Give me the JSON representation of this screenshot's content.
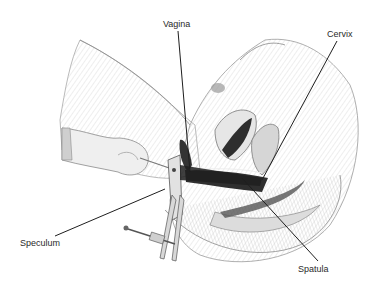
{
  "diagram": {
    "type": "anatomical-illustration",
    "labels": [
      {
        "id": "vagina",
        "text": "Vagina",
        "x": 163,
        "y": 19,
        "line": [
          178,
          31,
          190,
          172
        ]
      },
      {
        "id": "cervix",
        "text": "Cervix",
        "x": 327,
        "y": 29,
        "line": [
          337,
          41,
          262,
          180
        ]
      },
      {
        "id": "speculum",
        "text": "Speculum",
        "x": 20,
        "y": 238,
        "line": [
          55,
          236,
          165,
          189
        ]
      },
      {
        "id": "spatula",
        "text": "Spatula",
        "x": 298,
        "y": 264,
        "line": [
          318,
          261,
          242,
          178
        ]
      }
    ],
    "colors": {
      "background": "#ffffff",
      "sketch": "#9a9a9a",
      "shade_light": "#e4e4e4",
      "shade_mid": "#bdbdbd",
      "shade_dark": "#3a3a3a",
      "leader_line": "#1e1e1e",
      "label_text": "#2a2a2a"
    }
  }
}
